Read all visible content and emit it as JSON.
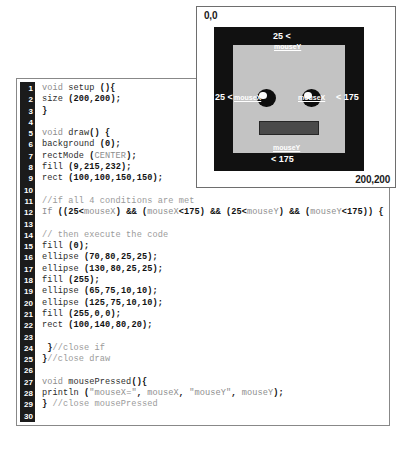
{
  "sketch": {
    "corner_top_left": "0,0",
    "corner_bottom_right": "200,200",
    "annotations": {
      "top_number": "25 <",
      "top_variable": "mouseY",
      "left_number": "25 <",
      "left_variable": "mouseX",
      "right_variable": "mouseX",
      "right_number": "< 175",
      "bottom_variable": "mouseY",
      "bottom_number": "< 175"
    },
    "colors": {
      "canvas_background": "#111111",
      "face_fill": "#c3c3c3",
      "eye_fill": "#0d0d0d",
      "eye_highlight_fill": "#fbfbfb",
      "mouth_fill": "#4a4a4a",
      "annotation_text": "#ffffff"
    }
  },
  "editor": {
    "gutter_background": "#1b1b1b",
    "gutter_text_color": "#ffffff",
    "line_numbers": [
      1,
      2,
      3,
      4,
      5,
      6,
      7,
      8,
      9,
      10,
      11,
      12,
      13,
      14,
      15,
      16,
      17,
      18,
      19,
      20,
      21,
      22,
      23,
      24,
      25,
      26,
      27,
      28,
      29,
      30
    ],
    "lines": [
      "void setup (){",
      "size (200,200);",
      "}",
      "",
      "void draw() {",
      "background (0);",
      "rectMode (CENTER);",
      "fill (9,215,232);",
      "rect (100,100,150,150);",
      "",
      "//if all 4 conditions are met",
      "If ((25<mouseX) && (mouseX<175) && (25<mouseY) && (mouseY<175)) {",
      "",
      "// then execute the code",
      "fill (0);",
      "ellipse (70,80,25,25);",
      "ellipse (130,80,25,25);",
      "fill (255);",
      "ellipse (65,75,10,10);",
      "ellipse (125,75,10,10);",
      "fill (255,0,0);",
      "rect (100,140,80,20);",
      "",
      " }//close if",
      "}//close draw",
      "",
      "void mousePressed(){",
      "println (\"mouseX=\", mouseX, \"mouseY\", mouseY);",
      "} //close mousePressed",
      ""
    ]
  }
}
